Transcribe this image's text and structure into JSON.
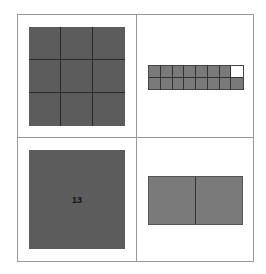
{
  "diagram": {
    "layout": "2x2 panel grid",
    "colors": {
      "dark_fill": "#5c5c5c",
      "mid_fill": "#7a7a7a",
      "empty_fill": "#ffffff",
      "frame": "#9a9a9a"
    },
    "panels": [
      {
        "id": "top-left",
        "shape": "square grid",
        "rows": 3,
        "cols": 3,
        "filled": 9,
        "label": ""
      },
      {
        "id": "top-right",
        "shape": "rectangular strip",
        "rows": 2,
        "cols": 8,
        "filled": 15,
        "empty_cells": [
          "row1-col8"
        ],
        "label": ""
      },
      {
        "id": "bottom-left",
        "shape": "single square",
        "rows": 1,
        "cols": 1,
        "filled": 1,
        "label": "13"
      },
      {
        "id": "bottom-right",
        "shape": "rectangle",
        "rows": 1,
        "cols": 2,
        "filled": 2,
        "label": ""
      }
    ]
  }
}
